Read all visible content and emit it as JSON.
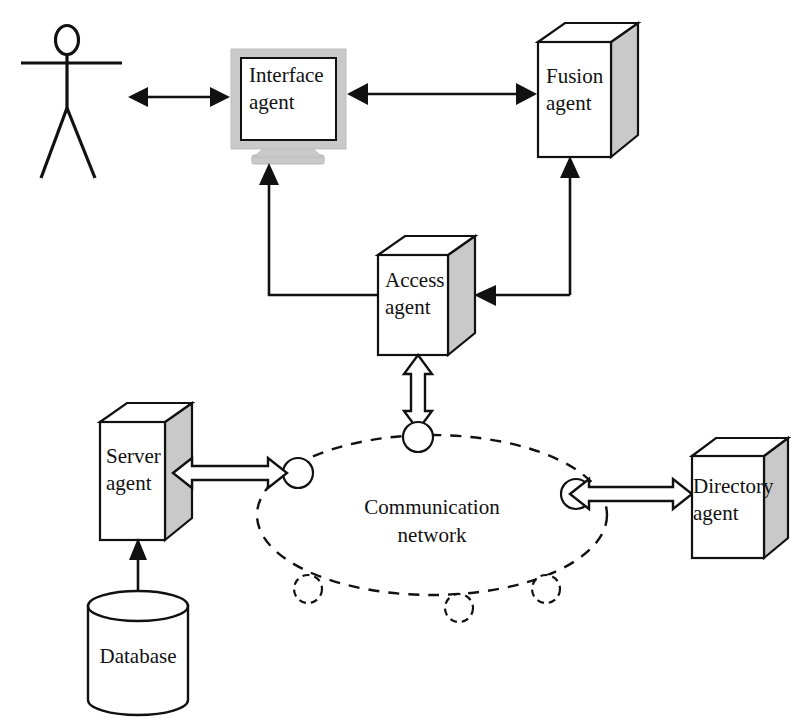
{
  "diagram": {
    "type": "block-diagram",
    "background": "#ffffff",
    "line_color": "#111111",
    "box_side_color": "#c9c9c9",
    "monitor_bezel_color": "#c9c9c9",
    "width": 803,
    "height": 721
  },
  "nodes": {
    "user": {
      "label": "",
      "shape": "stick-figure",
      "x": 70,
      "y": 95
    },
    "interface_agent": {
      "label_line1": "Interface",
      "label_line2": "agent",
      "shape": "monitor",
      "x": 290,
      "y": 100
    },
    "fusion_agent": {
      "label_line1": "Fusion",
      "label_line2": "agent",
      "shape": "3d-box",
      "x": 575,
      "y": 93
    },
    "access_agent": {
      "label_line1": "Access",
      "label_line2": "agent",
      "shape": "3d-box",
      "x": 412,
      "y": 291
    },
    "server_agent": {
      "label_line1": "Server",
      "label_line2": "agent",
      "shape": "3d-box",
      "x": 137,
      "y": 470
    },
    "directory_agent": {
      "label_line1": "Directory",
      "label_line2": "agent",
      "shape": "3d-box",
      "x": 735,
      "y": 495
    },
    "database": {
      "label": "Database",
      "shape": "cylinder",
      "x": 138,
      "y": 650
    },
    "communication_network": {
      "label_line1": "Communication",
      "label_line2": "network",
      "shape": "dashed-ellipse-ring",
      "x": 432,
      "y": 515
    }
  },
  "network_ring": {
    "center_x": 432,
    "center_y": 515,
    "radius_x": 175,
    "radius_y": 80,
    "nodes": [
      {
        "name": "node-top",
        "x": 418,
        "y": 437,
        "style": "solid"
      },
      {
        "name": "node-left",
        "x": 298,
        "y": 473,
        "style": "solid"
      },
      {
        "name": "node-right",
        "x": 576,
        "y": 494,
        "style": "solid"
      },
      {
        "name": "node-bottom-left",
        "x": 308,
        "y": 589,
        "style": "dashed"
      },
      {
        "name": "node-bottom",
        "x": 459,
        "y": 608,
        "style": "dashed"
      },
      {
        "name": "node-bottom-right",
        "x": 546,
        "y": 589,
        "style": "dashed"
      }
    ]
  },
  "connections": [
    {
      "name": "user-to-interface",
      "style": "solid",
      "heads": "both",
      "from": "user",
      "to": "interface_agent"
    },
    {
      "name": "interface-to-fusion",
      "style": "solid",
      "heads": "both",
      "from": "interface_agent",
      "to": "fusion_agent"
    },
    {
      "name": "access-to-interface",
      "style": "solid",
      "heads": "end",
      "from": "access_agent",
      "to": "interface_agent"
    },
    {
      "name": "access-to-fusion",
      "style": "solid",
      "heads": "end",
      "from": "access_agent",
      "to": "fusion_agent"
    },
    {
      "name": "fusion-to-access",
      "style": "solid",
      "heads": "end",
      "from": "fusion_agent",
      "to": "access_agent"
    },
    {
      "name": "access-to-network",
      "style": "hollow",
      "heads": "both",
      "from": "access_agent",
      "to": "communication_network"
    },
    {
      "name": "server-to-network",
      "style": "hollow",
      "heads": "both",
      "from": "server_agent",
      "to": "communication_network"
    },
    {
      "name": "network-to-directory",
      "style": "hollow",
      "heads": "both",
      "from": "communication_network",
      "to": "directory_agent"
    },
    {
      "name": "database-to-server",
      "style": "solid",
      "heads": "end",
      "from": "database",
      "to": "server_agent"
    }
  ]
}
